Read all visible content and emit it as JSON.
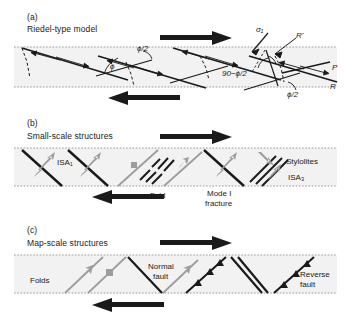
{
  "figure": {
    "background": "#ffffff",
    "band_fill": "#f2f2f2",
    "band_border": "#9a9a9a",
    "ink": "#1a1a1a",
    "gray_structure": "#9d9d9d"
  },
  "panels": [
    {
      "letter": "(a)",
      "title": "Riedel-type model",
      "labels": [
        {
          "name": "sigma1",
          "text": "σ₁"
        },
        {
          "name": "r-prime",
          "text": "R'"
        },
        {
          "name": "p-shear",
          "text": "P"
        },
        {
          "name": "r-shear",
          "text": "R"
        },
        {
          "name": "angle-phi",
          "text": "ϕ"
        },
        {
          "name": "angle-phi-half-upper",
          "text": "ϕ/2"
        },
        {
          "name": "angle-90-minus-phi-half",
          "text": "90−ϕ/2"
        },
        {
          "name": "angle-phi-half-lower",
          "text": "ϕ/2"
        }
      ],
      "shear_sense": {
        "top": "right",
        "bottom": "left"
      }
    },
    {
      "letter": "(b)",
      "title": "Small-scale structures",
      "labels": [
        {
          "name": "isa1",
          "text": "ISA₁"
        },
        {
          "name": "fold",
          "text": "Fold"
        },
        {
          "name": "mode-i-fracture-line1",
          "text": "Mode I"
        },
        {
          "name": "mode-i-fracture-line2",
          "text": "fracture"
        },
        {
          "name": "stylolites",
          "text": "Stylolites"
        },
        {
          "name": "isa3",
          "text": "ISA₃"
        }
      ],
      "shear_sense": {
        "top": "right",
        "bottom": "left"
      }
    },
    {
      "letter": "(c)",
      "title": "Map-scale structures",
      "labels": [
        {
          "name": "folds",
          "text": "Folds"
        },
        {
          "name": "normal-fault-line1",
          "text": "Normal"
        },
        {
          "name": "normal-fault-line2",
          "text": "fault"
        },
        {
          "name": "reverse-fault-line1",
          "text": "Reverse"
        },
        {
          "name": "reverse-fault-line2",
          "text": "fault"
        }
      ],
      "shear_sense": {
        "top": "right",
        "bottom": "left"
      }
    }
  ]
}
